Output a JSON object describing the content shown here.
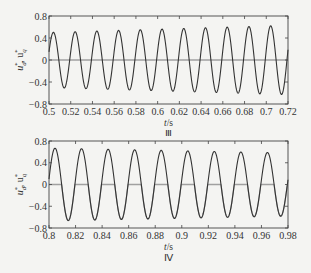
{
  "chart_data": [
    {
      "type": "line",
      "panel_label": "Ⅲ",
      "xlabel": "t/s",
      "ylabel": "u_d*, u_q*",
      "xlim": [
        0.5,
        0.72
      ],
      "ylim": [
        -0.8,
        0.8
      ],
      "xticks": [
        "0.5",
        "0.52",
        "0.54",
        "0.56",
        "0.58",
        "0.6",
        "0.62",
        "0.64",
        "0.66",
        "0.68",
        "0.7",
        "0.72"
      ],
      "yticks": [
        "0.8",
        "0.4",
        "0",
        "-0.4",
        "-0.8"
      ],
      "grid": false,
      "frequency_hz": 50,
      "series": [
        {
          "name": "u_d*",
          "color": "#333333",
          "description": "sinusoid, amplitude growing from ~0.5 to ~0.63",
          "amplitude_start": 0.5,
          "amplitude_end": 0.63
        },
        {
          "name": "u_q*",
          "color": "#9a9a9a",
          "description": "near zero throughout",
          "value": 0
        }
      ]
    },
    {
      "type": "line",
      "panel_label": "Ⅳ",
      "xlabel": "t/s",
      "ylabel": "u_d*, u_q*",
      "xlim": [
        0.8,
        0.98
      ],
      "ylim": [
        -0.8,
        0.8
      ],
      "xticks": [
        "0.8",
        "0.82",
        "0.84",
        "0.86",
        "0.88",
        "0.9",
        "0.92",
        "0.94",
        "0.96",
        "0.98"
      ],
      "yticks": [
        "0.8",
        "0.4",
        "0",
        "-0.4",
        "-0.8"
      ],
      "grid": false,
      "frequency_hz": 50,
      "series": [
        {
          "name": "u_d*",
          "color": "#333333",
          "description": "sinusoid, amplitude ~0.67 decaying to ~0.58",
          "amplitude_start": 0.67,
          "amplitude_end": 0.58
        },
        {
          "name": "u_q*",
          "color": "#9a9a9a",
          "description": "zero with segments following the sinusoid near zero crossings",
          "value": 0
        }
      ]
    }
  ]
}
